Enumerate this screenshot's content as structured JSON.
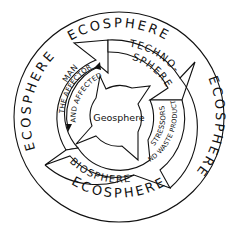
{
  "diagram": {
    "outer_ring_labels": [
      "ECOSPHERE",
      "ECOSPHERE",
      "ECOSPHERE",
      "ECOSPHERE"
    ],
    "middle_ring_labels": {
      "man": "MAN",
      "techno_line1": "TECHNO-",
      "techno_line2": "SPHERE",
      "biosphere": "BIOSPHERE"
    },
    "annotations": {
      "affector": "THE AFFECTOR",
      "affected": "AND AFFECTED",
      "stressors": "STRESSORS",
      "waste": "AND WASTE PRODUCTS"
    },
    "center_label": "Geosphere",
    "colors": {
      "stroke": "#111111",
      "background": "#ffffff"
    }
  }
}
